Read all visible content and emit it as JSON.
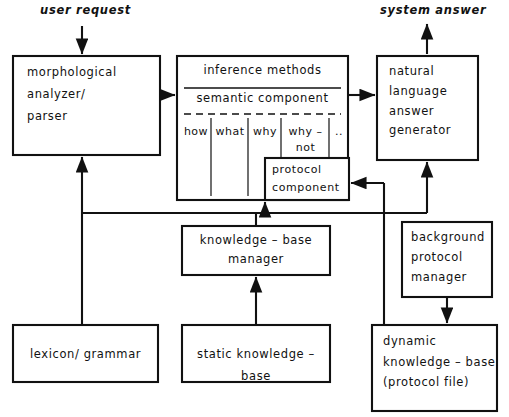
{
  "diagram": {
    "stroke_color": "#111111",
    "background_color": "#ffffff",
    "io_labels": {
      "input": "user request",
      "output": "system answer"
    },
    "boxes": {
      "morphological_analyzer": "morphological\nanalyzer/\nparser",
      "inference_methods": "inference methods",
      "semantic_component": "semantic component",
      "protocol_component": "protocol\ncomponent",
      "natural_language_generator": "natural\nlanguage\nanswer\ngenerator",
      "knowledge_base_manager": "knowledge – base\nmanager",
      "background_protocol_manager": "background\nprotocol\nmanager",
      "lexicon_grammar": "lexicon/ grammar",
      "static_knowledge_base": "static knowledge – base",
      "dynamic_knowledge_base": "dynamic\nknowledge – base\n(protocol file)"
    },
    "semantic_cells": [
      {
        "label": "how"
      },
      {
        "label": "what"
      },
      {
        "label": "why"
      },
      {
        "label": "why –\nnot"
      },
      {
        "label": ".."
      }
    ]
  }
}
